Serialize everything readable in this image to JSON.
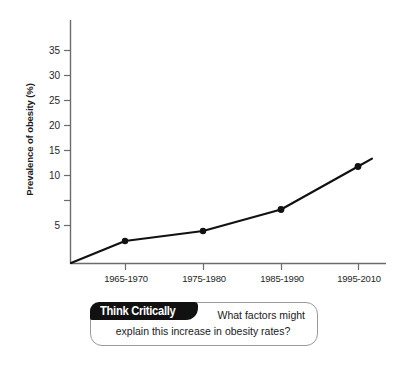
{
  "chart_data": {
    "type": "line",
    "title": "",
    "subtitle": "",
    "xlabel": "",
    "ylabel": "Prevalence of obesity (%)",
    "categories": [
      "1965-1970",
      "1975-1980",
      "1985-1990",
      "1995-2010"
    ],
    "values": [
      4.4,
      6.4,
      10.7,
      19.3
    ],
    "series": [
      {
        "name": "Prevalence of obesity",
        "values": [
          4.4,
          6.4,
          10.7,
          19.3
        ]
      }
    ],
    "y_ticks": [
      5,
      10,
      15,
      20,
      25,
      30,
      35
    ],
    "ylim": [
      0,
      38
    ],
    "grid": false,
    "legend": false,
    "legend_position": "none",
    "markers": "filled-circle",
    "line_color": "#111111",
    "axis_color": "#6b6b6b",
    "annotations": [
      {
        "kind": "line-extends-beyond-last-point",
        "note": "Trend line continues past final marker to about 20.6%"
      },
      {
        "kind": "line-starts-at-origin",
        "note": "Trend line begins at the axis origin at 0%"
      }
    ]
  },
  "axis": {
    "y_tick_labels": [
      "35",
      "30",
      "25",
      "20",
      "15",
      "10",
      "5"
    ],
    "x_tick_labels": [
      "1965-1970",
      "1975-1980",
      "1985-1990",
      "1995-2010"
    ],
    "y_title": "Prevalence of obesity (%)"
  },
  "callout": {
    "tab_label": "Think Critically",
    "question_line1": "What factors might",
    "question_line2": "explain this increase in obesity rates?"
  },
  "colors": {
    "line": "#111111",
    "marker": "#111111",
    "axis": "#6b6b6b",
    "callout_tab_bg": "#111111",
    "callout_tab_text": "#ffffff",
    "callout_border": "#9a9a9a",
    "text": "#1a1a1a",
    "background": "#ffffff"
  }
}
